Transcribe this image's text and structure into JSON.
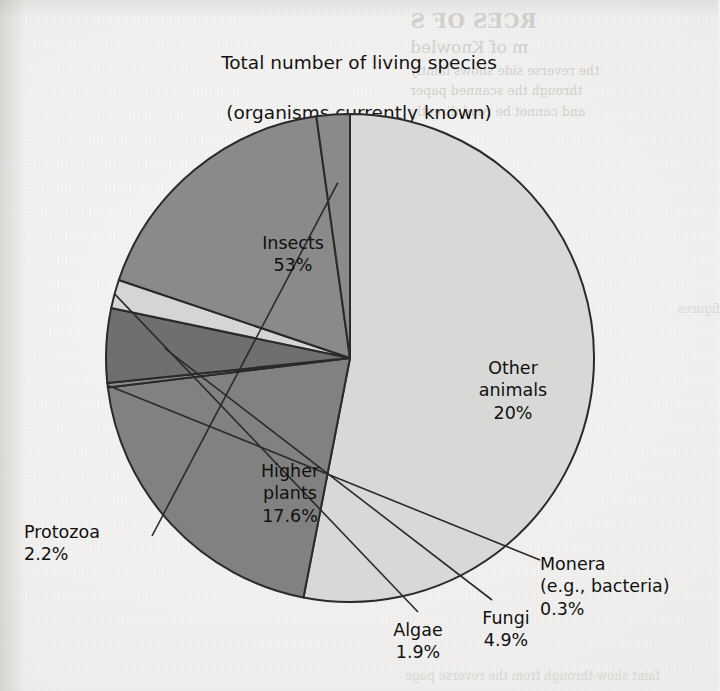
{
  "figure": {
    "title_lines": [
      "Total number of living species",
      "(organisms currently known)",
      "1,413,000"
    ],
    "total_label": "Total number of living species",
    "total_parenthetical": "(organisms currently known)",
    "total_value": "1,413,000"
  },
  "chart_data": {
    "type": "pie",
    "title": "Total number of living species (organisms currently known) 1,413,000",
    "total": 1413000,
    "total_display": "1,413,000",
    "units": "percent",
    "start_angle_deg": 0,
    "direction": "clockwise",
    "legend": "none",
    "grid": false,
    "categories": [
      "Insects",
      "Other animals",
      "Monera (e.g., bacteria)",
      "Fungi",
      "Algae",
      "Higher plants",
      "Protozoa"
    ],
    "values": [
      53,
      20,
      0.3,
      4.9,
      1.9,
      17.6,
      2.2
    ],
    "slices": [
      {
        "id": "insects",
        "name": "Insects",
        "name_lines": [
          "Insects"
        ],
        "value": 53,
        "value_label": "53%",
        "color": "#d8d8d7",
        "label_placement": "inside"
      },
      {
        "id": "other-animals",
        "name": "Other animals",
        "name_lines": [
          "Other",
          "animals"
        ],
        "value": 20,
        "value_label": "20%",
        "color": "#818181",
        "label_placement": "inside"
      },
      {
        "id": "monera",
        "name": "Monera (e.g., bacteria)",
        "name_lines": [
          "Monera",
          "(e.g., bacteria)"
        ],
        "value": 0.3,
        "value_label": "0.3%",
        "color": "#8d8d8d",
        "label_placement": "outside-leader"
      },
      {
        "id": "fungi",
        "name": "Fungi",
        "name_lines": [
          "Fungi"
        ],
        "value": 4.9,
        "value_label": "4.9%",
        "color": "#6f6f6f",
        "label_placement": "outside-leader"
      },
      {
        "id": "algae",
        "name": "Algae",
        "name_lines": [
          "Algae"
        ],
        "value": 1.9,
        "value_label": "1.9%",
        "color": "#d5d5d4",
        "label_placement": "outside-leader"
      },
      {
        "id": "higher-plants",
        "name": "Higher plants",
        "name_lines": [
          "Higher",
          "plants"
        ],
        "value": 17.6,
        "value_label": "17.6%",
        "color": "#8a8a8a",
        "label_placement": "inside"
      },
      {
        "id": "protozoa",
        "name": "Protozoa",
        "name_lines": [
          "Protozoa"
        ],
        "value": 2.2,
        "value_label": "2.2%",
        "color": "#8a8a8a",
        "label_placement": "outside-leader"
      }
    ],
    "labels": {
      "insects": "Insects\n53%",
      "other_animals": "Other\nanimals\n20%",
      "higher_plants": "Higher\nplants\n17.6%",
      "protozoa": "Protozoa\n2.2%",
      "algae": "Algae\n1.9%",
      "fungi": "Fungi\n4.9%",
      "monera": "Monera\n(e.g., bacteria)\n0.3%"
    },
    "colors": {
      "insects": "#d8d8d7",
      "other_animals": "#818181",
      "higher_plants": "#8a8a8a",
      "protozoa": "#8a8a8a",
      "algae": "#d5d5d4",
      "fungi": "#6f6f6f",
      "monera": "#8d8d8d",
      "outline": "#2a2a2a",
      "page_background": "#f1f0ee",
      "text": "#111111"
    }
  },
  "page_bleed": {
    "heading": "RCES OF S",
    "subheading": "m of Knowled",
    "body_lines": [
      "the reverse side shows faintly",
      "through the scanned paper",
      "and cannot be read directly"
    ],
    "margin_note": "figures",
    "footer": "faint show-through from the reverse page"
  }
}
